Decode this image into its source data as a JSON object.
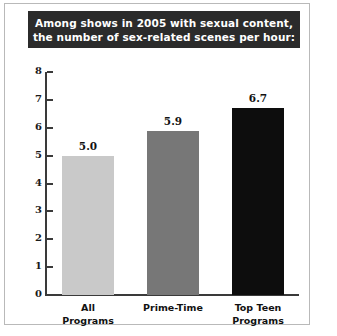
{
  "chart_data": {
    "type": "bar",
    "title": "Among shows in 2005 with sexual content, the number of sex-related scenes per hour:",
    "title_lines": [
      "Among shows in 2005 with sexual content,",
      "the number of sex-related scenes per hour:"
    ],
    "categories": [
      "All Programs",
      "Prime-Time",
      "Top Teen Programs"
    ],
    "category_lines": [
      [
        "All",
        "Programs"
      ],
      [
        "Prime-Time",
        ""
      ],
      [
        "Top Teen",
        "Programs"
      ]
    ],
    "values": [
      5.0,
      5.9,
      6.7
    ],
    "value_labels": [
      "5.0",
      "5.9",
      "6.7"
    ],
    "bar_colors": [
      "#c9c9c9",
      "#777777",
      "#0d0d0d"
    ],
    "xlabel": "",
    "ylabel": "",
    "ylim": [
      0,
      8
    ],
    "yticks": [
      0,
      1,
      2,
      3,
      4,
      5,
      6,
      7,
      8
    ],
    "ytick_labels": [
      "0",
      "1",
      "2",
      "3",
      "4",
      "5",
      "6",
      "7",
      "8"
    ],
    "grid": false,
    "legend": false
  },
  "style": {
    "banner_background": "#2b2b2b",
    "banner_text_color": "#ffffff",
    "axis_color": "#3a3a3a",
    "frame_color": "#b9b9b9",
    "page_background": "#ffffff"
  }
}
